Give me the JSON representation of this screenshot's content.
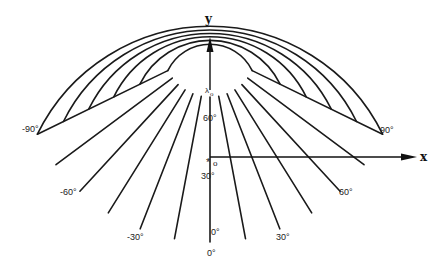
{
  "figure": {
    "type": "conic-projection-graticule",
    "apex": {
      "x": 210,
      "y": 50
    },
    "radii": [
      47,
      78,
      107,
      135,
      163,
      192
    ],
    "half_angle_deg": 64,
    "longitudes_deg": [
      -90,
      -75,
      -60,
      -45,
      -30,
      -15,
      0,
      15,
      30,
      45,
      60,
      75,
      90
    ],
    "line_color": "#1a1a1a"
  },
  "axes": {
    "y": {
      "label": "y",
      "from": {
        "x": 210,
        "y": 90
      },
      "to": {
        "x": 210,
        "y": 38
      }
    },
    "x": {
      "label": "x",
      "from": {
        "x": 210,
        "y": 157
      },
      "to": {
        "x": 416,
        "y": 157
      }
    }
  },
  "labels": {
    "lambda0": "λ",
    "lambda0_sub": "o",
    "origin_marker": "*",
    "origin_sub": "o",
    "lat_60": "60°",
    "lat_30": "30°",
    "lat_0_inner": "0°",
    "lon_0": "0°",
    "lon_m30": "-30°",
    "lon_30": "30°",
    "lon_m60": "-60°",
    "lon_60": "60°",
    "lon_m90": "-90°",
    "lon_90": "90°"
  }
}
